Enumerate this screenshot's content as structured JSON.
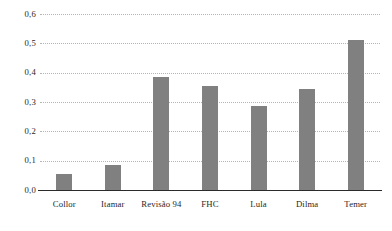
{
  "chart_data": {
    "type": "bar",
    "title": "",
    "subtitle": "",
    "xlabel": "",
    "ylabel": "",
    "categories": [
      "Collor",
      "Itamar",
      "Revisão 94",
      "FHC",
      "Lula",
      "Dilma",
      "Temer"
    ],
    "values": [
      0.055,
      0.085,
      0.385,
      0.355,
      0.285,
      0.345,
      0.51
    ],
    "ylim": [
      0.0,
      0.6
    ],
    "ytick_values": [
      0.0,
      0.1,
      0.2,
      0.3,
      0.4,
      0.5,
      0.6
    ],
    "ytick_labels": [
      "0,0",
      "0,1",
      "0,2",
      "0,3",
      "0,4",
      "0,5",
      "0,6"
    ],
    "grid": true,
    "grid_axis": "y",
    "grid_style": "dotted",
    "legend": false,
    "legend_position": "none",
    "bar_color": "#808080",
    "grid_color": "#b4b4b4",
    "axis_color": "#2b2b2b",
    "background_color": "#ffffff",
    "decimal_separator": ","
  }
}
